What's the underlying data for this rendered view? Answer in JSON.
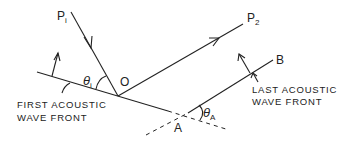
{
  "diagram": {
    "points": {
      "p1": {
        "main": "P",
        "sub": "i"
      },
      "p2": {
        "main": "P",
        "sub": "2"
      },
      "o": "O",
      "a": "A",
      "b": "B"
    },
    "angles": {
      "theta_i": {
        "main": "θ",
        "sub": "i"
      },
      "theta_a": {
        "main": "θ",
        "sub": "A"
      }
    },
    "captions": {
      "first_line1": "FIRST ACOUSTIC",
      "first_line2": "WAVE FRONT",
      "last_line1": "LAST ACOUSTIC",
      "last_line2": "WAVE FRONT"
    },
    "colors": {
      "ink": "#222222",
      "background": "#ffffff"
    }
  }
}
